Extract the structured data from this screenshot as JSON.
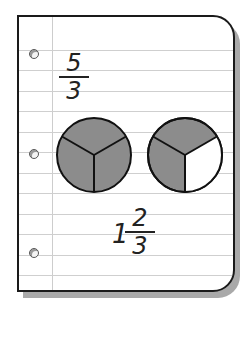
{
  "top_fraction": {
    "numerator": "5",
    "denominator": "3"
  },
  "circles": [
    {
      "label": "circle-1",
      "parts": 3,
      "shaded_parts": 3
    },
    {
      "label": "circle-2",
      "parts": 3,
      "shaded_parts": 2
    }
  ],
  "mixed_number": {
    "whole": "1",
    "numerator": "2",
    "denominator": "3"
  },
  "colors": {
    "shade": "#8c8c8c",
    "outline": "#111111",
    "rule": "#cfcfcf",
    "shadow": "#a9a9a9"
  }
}
